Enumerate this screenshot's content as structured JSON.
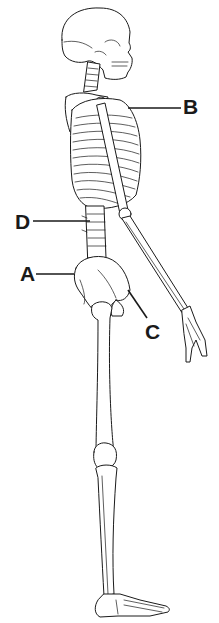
{
  "diagram": {
    "labels": [
      {
        "id": "A",
        "text": "A",
        "points_to": "ilium / pelvis (iliac crest)"
      },
      {
        "id": "B",
        "text": "B",
        "points_to": "rib cage / sternum region"
      },
      {
        "id": "C",
        "text": "C",
        "points_to": "pubis / anterior pelvis"
      },
      {
        "id": "D",
        "text": "D",
        "points_to": "lumbar vertebrae"
      }
    ]
  },
  "colors": {
    "ink": "#1a1a1a",
    "background": "#ffffff"
  }
}
